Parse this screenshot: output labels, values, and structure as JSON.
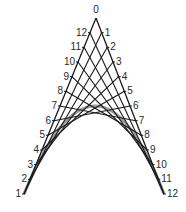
{
  "diagram": {
    "type": "string-art-parabola",
    "apex_label": "0",
    "apex": [
      96,
      18
    ],
    "left_base": [
      24,
      194
    ],
    "right_base": [
      164,
      194
    ],
    "divisions": 12,
    "left_labels": [
      "12",
      "11",
      "10",
      "9",
      "8",
      "7",
      "6",
      "5",
      "4",
      "3",
      "2",
      "1"
    ],
    "right_labels": [
      "1",
      "2",
      "3",
      "4",
      "5",
      "6",
      "7",
      "8",
      "9",
      "10",
      "11",
      "12"
    ],
    "connections": "left point k joined to right point k for k = 1..12",
    "colors": {
      "lines": "#1a1a1a",
      "envelope": "#9a9a9a",
      "labels": "#2a2a2a",
      "background": "#ffffff"
    }
  }
}
